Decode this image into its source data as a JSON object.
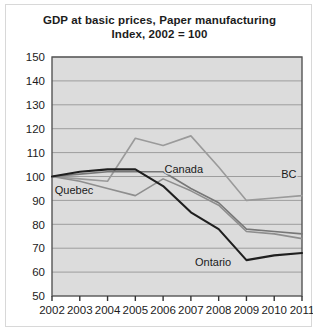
{
  "chart_data": {
    "type": "line",
    "title": "GDP at basic prices, Paper manufacturing",
    "subtitle": "Index, 2002 = 100",
    "title_line1": "GDP at basic prices, Paper manufacturing",
    "title_line2": "Index, 2002 = 100",
    "xlabel": "",
    "ylabel": "",
    "x": [
      2002,
      2003,
      2004,
      2005,
      2006,
      2007,
      2008,
      2009,
      2010,
      2011
    ],
    "categories": [
      "2002",
      "2003",
      "2004",
      "2005",
      "2006",
      "2007",
      "2008",
      "2009",
      "2010",
      "2011"
    ],
    "xlim": [
      2002,
      2011
    ],
    "ylim": [
      50,
      150
    ],
    "yticks": [
      50,
      60,
      70,
      80,
      90,
      100,
      110,
      120,
      130,
      140,
      150
    ],
    "ytick_labels": [
      "50",
      "60",
      "70",
      "80",
      "90",
      "100",
      "110",
      "120",
      "130",
      "140",
      "150"
    ],
    "grid": true,
    "grid_axis": "y",
    "legend": "inline-labels",
    "plot_background": "#dcdcdc",
    "series": [
      {
        "name": "BC",
        "label": "BC",
        "color": "#9a9a9a",
        "width": 1.6,
        "values": [
          100,
          99,
          98,
          116,
          113,
          117,
          104,
          90,
          91,
          92
        ],
        "label_x": 2010.25,
        "label_y": 99.5
      },
      {
        "name": "Canada",
        "label": "Canada",
        "color": "#777777",
        "width": 1.6,
        "values": [
          100,
          101,
          102,
          102,
          102,
          95,
          89,
          78,
          77,
          76
        ],
        "label_x": 2006.05,
        "label_y": 101.5
      },
      {
        "name": "Quebec",
        "label": "Quebec",
        "color": "#8e8e8e",
        "width": 1.6,
        "values": [
          100,
          98,
          95,
          92,
          99,
          94,
          88,
          77,
          76,
          74
        ],
        "label_x": 2002.1,
        "label_y": 92.5
      },
      {
        "name": "Ontario",
        "label": "Ontario",
        "color": "#1f1f1f",
        "width": 2.1,
        "values": [
          100,
          102,
          103,
          103,
          96,
          85,
          78,
          65,
          67,
          68
        ],
        "label_x": 2007.15,
        "label_y": 62.5
      }
    ]
  }
}
